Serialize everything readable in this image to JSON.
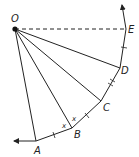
{
  "diagram": {
    "points": {
      "O": {
        "label": "O",
        "x": 15,
        "y": 29
      },
      "A": {
        "label": "A",
        "x": 36,
        "y": 141
      },
      "B": {
        "label": "B",
        "x": 72,
        "y": 128
      },
      "C": {
        "label": "C",
        "x": 101,
        "y": 101
      },
      "D": {
        "label": "D",
        "x": 120,
        "y": 68
      },
      "E": {
        "label": "E",
        "x": 126,
        "y": 29
      }
    },
    "angle_labels": [
      "x",
      "x"
    ],
    "colors": {
      "stroke": "#222222",
      "background": "#ffffff"
    }
  }
}
